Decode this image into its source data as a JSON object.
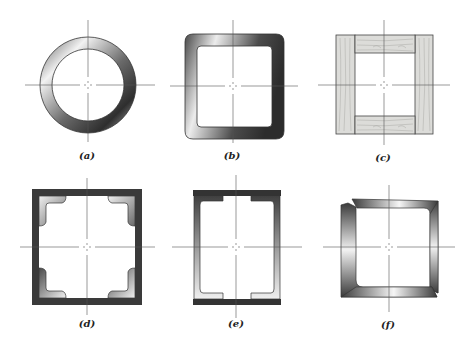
{
  "figure": {
    "panels": [
      {
        "id": "a",
        "label": "(a)",
        "shape": "circular tube",
        "center": [
          88,
          85
        ],
        "label_pos": [
          87,
          150
        ]
      },
      {
        "id": "b",
        "label": "(b)",
        "shape": "rounded square tube",
        "center": [
          233,
          86
        ],
        "label_pos": [
          232,
          150
        ]
      },
      {
        "id": "c",
        "label": "(c)",
        "shape": "wooden box section",
        "center": [
          384,
          85
        ],
        "label_pos": [
          383,
          152
        ]
      },
      {
        "id": "d",
        "label": "(d)",
        "shape": "box of plates with corner angles",
        "center": [
          87,
          247
        ],
        "label_pos": [
          87,
          313
        ]
      },
      {
        "id": "e",
        "label": "(e)",
        "shape": "two channels with cover plates",
        "center": [
          236,
          247
        ],
        "label_pos": [
          236,
          313
        ]
      },
      {
        "id": "f",
        "label": "(f)",
        "shape": "two bent angles welded",
        "center": [
          389,
          247
        ],
        "label_pos": [
          388,
          313
        ]
      }
    ]
  },
  "colors": {
    "steel_dark": "#3a3a3a",
    "steel_mid": "#8a8a8a",
    "steel_light": "#eeeeee",
    "plate": "#3c3c3c",
    "wood": "#d9d9d6",
    "wood_grain": "#a9a9a6",
    "axis": "#555555",
    "outline": "#333333"
  }
}
